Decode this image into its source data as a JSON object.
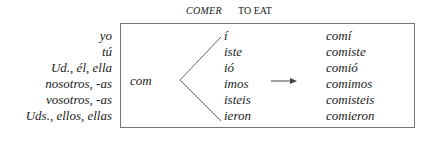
{
  "header": {
    "verb": "COMER",
    "meaning": "TO EAT"
  },
  "pronouns": [
    "yo",
    "tú",
    "Ud., él, ella",
    "nosotros, -as",
    "vosotros, -as",
    "Uds., ellos, ellas"
  ],
  "stem": "com",
  "endings": [
    "í",
    "iste",
    "ió",
    "imos",
    "isteis",
    "ieron"
  ],
  "conjugated_forms": [
    "comí",
    "comiste",
    "comió",
    "comimos",
    "comisteis",
    "comieron"
  ],
  "icons": {
    "branch": "branch-lines",
    "arrow": "right-arrow"
  }
}
